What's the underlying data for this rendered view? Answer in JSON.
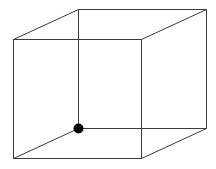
{
  "diagram": {
    "type": "wireframe-cube",
    "colors": {
      "edge": "#3a3a3a",
      "marker": "#000000",
      "background": "#ffffff"
    },
    "faces": [
      "front",
      "back"
    ],
    "edges": [
      {
        "name": "front-top"
      },
      {
        "name": "front-bottom"
      },
      {
        "name": "front-left"
      },
      {
        "name": "front-right"
      },
      {
        "name": "back-top"
      },
      {
        "name": "back-bottom"
      },
      {
        "name": "back-left"
      },
      {
        "name": "back-right"
      },
      {
        "name": "connector-top-left"
      },
      {
        "name": "connector-top-right"
      },
      {
        "name": "connector-bottom-left"
      },
      {
        "name": "connector-bottom-right"
      }
    ],
    "highlighted_vertex": "back-bottom-left"
  }
}
